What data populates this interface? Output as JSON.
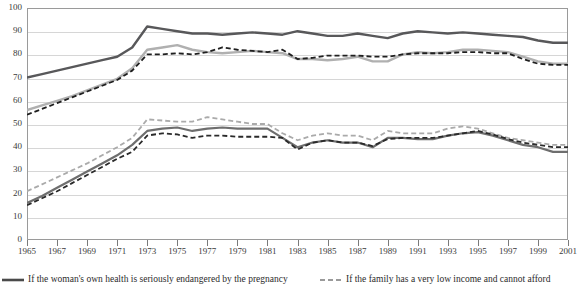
{
  "chart_data": {
    "type": "line",
    "title": "",
    "xlabel": "",
    "ylabel": "",
    "xlim": [
      1965,
      2001
    ],
    "ylim": [
      0,
      100
    ],
    "grid": true,
    "legend_position": "bottom",
    "y_ticks": [
      0,
      10,
      20,
      30,
      40,
      50,
      60,
      70,
      80,
      90,
      100
    ],
    "x_ticks": [
      1965,
      1967,
      1969,
      1971,
      1973,
      1975,
      1977,
      1979,
      1981,
      1983,
      1985,
      1987,
      1989,
      1991,
      1993,
      1995,
      1997,
      1999,
      2001
    ],
    "x": [
      1965,
      1966,
      1967,
      1968,
      1969,
      1970,
      1971,
      1972,
      1973,
      1974,
      1975,
      1976,
      1977,
      1978,
      1979,
      1980,
      1981,
      1982,
      1983,
      1984,
      1985,
      1986,
      1987,
      1988,
      1989,
      1990,
      1991,
      1992,
      1993,
      1994,
      1995,
      1996,
      1997,
      1998,
      1999,
      2000,
      2001
    ],
    "series": [
      {
        "name": "If the woman's own health is seriously endangered by the pregnancy",
        "style": "solid",
        "color": "#58585a",
        "width": 2.4,
        "values": [
          70,
          71.5,
          73,
          74.5,
          76,
          77.5,
          79,
          83,
          92,
          91,
          90,
          89,
          89,
          88.5,
          89,
          89.5,
          89,
          88.5,
          90,
          89,
          88,
          88,
          89,
          88,
          87,
          89,
          90,
          89.5,
          89,
          89.5,
          89,
          88.5,
          88,
          87.5,
          86,
          85,
          85
        ]
      },
      {
        "name": "If there is a strong chance of serious defect in the baby",
        "style": "solid",
        "color": "#b0b0b0",
        "width": 2.4,
        "values": [
          56,
          58,
          60,
          62,
          64.5,
          67,
          69.5,
          74,
          82,
          83,
          84,
          82,
          81,
          80.5,
          81,
          81.5,
          81,
          80.5,
          78,
          78,
          77.5,
          78,
          79,
          77,
          77,
          80,
          81,
          80.5,
          81,
          82,
          82,
          81.5,
          81,
          79,
          77,
          76,
          76
        ]
      },
      {
        "name": "If she became pregnant as a result of rape",
        "style": "dashed",
        "color": "#1f1f1f",
        "width": 1.8,
        "values": [
          54,
          56.5,
          59,
          61.5,
          64,
          66.5,
          69,
          73,
          80,
          80,
          80.5,
          80,
          81,
          83,
          82,
          81.5,
          81,
          82,
          78,
          78.5,
          79.5,
          79.5,
          79.5,
          79,
          79,
          80,
          80.5,
          80.5,
          80.5,
          81,
          81,
          80.5,
          80.5,
          78,
          76,
          75.5,
          75.5
        ]
      },
      {
        "name": "If the family has a very low income and cannot afford",
        "style": "dashed",
        "color": "#aaaaaa",
        "width": 1.8,
        "values": [
          21,
          24,
          27,
          30,
          33,
          36.5,
          40,
          44,
          52,
          51.5,
          51,
          51,
          53,
          52,
          51,
          50,
          50,
          46,
          43,
          45,
          46,
          45,
          45,
          43,
          47,
          46,
          46,
          46,
          48,
          49,
          48,
          46,
          44,
          43,
          42,
          41,
          41
        ]
      },
      {
        "name": "If she is not married and does not want to marry the man",
        "style": "solid",
        "color": "#6e6e6e",
        "width": 2.2,
        "values": [
          16,
          19,
          22.5,
          26,
          29.5,
          33,
          36.5,
          41,
          47,
          48,
          48.5,
          47,
          48,
          48.5,
          48,
          48,
          48,
          44,
          40,
          42,
          43,
          42,
          42,
          40,
          44,
          44,
          43.5,
          43.5,
          45,
          46,
          46.5,
          45,
          43,
          41,
          40,
          38,
          38
        ]
      },
      {
        "name": "If she is married and does not want any more children",
        "style": "dashed",
        "color": "#2a2a2a",
        "width": 1.8,
        "values": [
          15,
          18,
          21,
          24.5,
          28,
          31.5,
          35,
          38,
          45,
          46,
          45.5,
          44,
          45,
          45,
          44.5,
          44.5,
          44.5,
          44,
          39,
          42,
          43,
          42,
          42,
          40.5,
          43.5,
          44,
          44,
          44,
          45,
          46,
          47,
          45.5,
          43.5,
          42,
          41,
          40,
          40
        ]
      }
    ]
  },
  "axis": {
    "y_labels": [
      "100",
      "90",
      "80",
      "70",
      "60",
      "50",
      "40",
      "30",
      "20",
      "10",
      "0"
    ],
    "x_labels": [
      "1965",
      "1967",
      "1969",
      "1971",
      "1973",
      "1975",
      "1977",
      "1979",
      "1981",
      "1983",
      "1985",
      "1987",
      "1989",
      "1991",
      "1993",
      "1995",
      "1997",
      "1999",
      "2001"
    ]
  },
  "legend": {
    "entries": [
      {
        "label": "If the woman's own health is seriously endangered by the pregnancy",
        "style": "solid",
        "color": "#4a4a4a"
      },
      {
        "label": "If the family has a very low income and cannot afford",
        "style": "dashed",
        "color": "#9a9a9a"
      }
    ]
  },
  "colors": {
    "grid": "#d6d6d6",
    "frame": "#9a9a9a",
    "text": "#2b2b2b"
  }
}
